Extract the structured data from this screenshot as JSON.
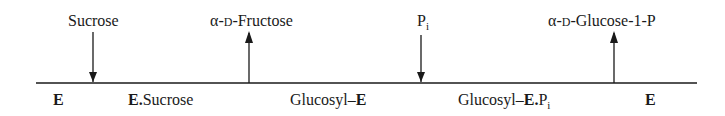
{
  "diagram": {
    "type": "reaction-scheme",
    "inputs_outputs": [
      {
        "label": "Sucrose",
        "direction": "in",
        "x": 93
      },
      {
        "alpha": "α",
        "d": "D",
        "rest": "-Fructose",
        "direction": "out",
        "x": 249
      },
      {
        "label": "P",
        "sub": "i",
        "direction": "in",
        "x": 421
      },
      {
        "alpha": "α",
        "d": "D",
        "rest": "-Glucose-1-P",
        "direction": "out",
        "x": 614
      }
    ],
    "states": [
      {
        "bold": "E",
        "normal": ""
      },
      {
        "bold": "E.",
        "normal": "Sucrose"
      },
      {
        "normal": "Glucosyl–",
        "bold": "E"
      },
      {
        "normal": "Glucosyl–",
        "bold": "E.",
        "tail": "P",
        "sub": "i"
      },
      {
        "bold": "E",
        "normal": ""
      }
    ],
    "line_color": "#1a1a1a"
  }
}
